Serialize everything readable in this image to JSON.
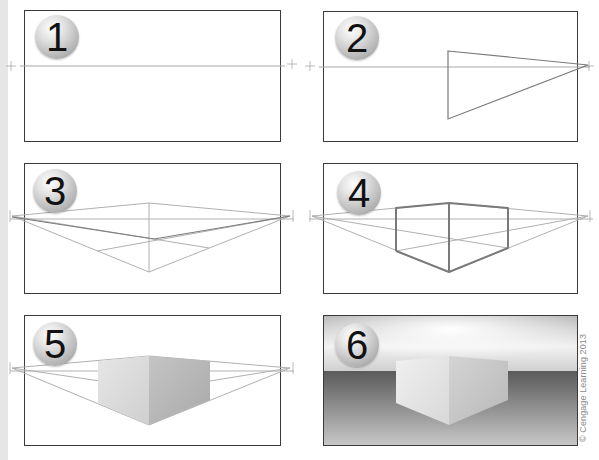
{
  "figure": {
    "steps": [
      {
        "number": "1",
        "description": "Horizon line with two vanishing points"
      },
      {
        "number": "2",
        "description": "Triangle converging to right vanishing point"
      },
      {
        "number": "3",
        "description": "Construction lines from both vanishing points to vertical edge"
      },
      {
        "number": "4",
        "description": "Box outline drawn over construction lines"
      },
      {
        "number": "5",
        "description": "Shaded box faces"
      },
      {
        "number": "6",
        "description": "Rendered box on ground plane with sky gradient"
      }
    ],
    "copyright": "© Cengage Learning 2013"
  },
  "colors": {
    "frame": "#3a3a3a",
    "guide_line": "#a8a8a8",
    "box_line": "#7a7a7a",
    "left_face": "#dcdcdc",
    "right_face": "#b9b9b9",
    "ground_dark": "#5e5e5e",
    "ground_light": "#c4c4c4",
    "sky_light": "#ffffff",
    "sky_dark": "#9a9a9a"
  }
}
